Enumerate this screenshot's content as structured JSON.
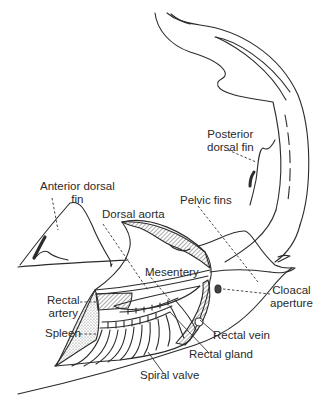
{
  "diagram": {
    "stroke_color": "#2b2b2b",
    "hatch_color": "#555555",
    "background": "#ffffff",
    "labels": {
      "posterior_dorsal_fin": {
        "line1": "Posterior",
        "line2": "dorsal fin"
      },
      "anterior_dorsal_fin": {
        "line1": "Anterior dorsal",
        "line2": "fin"
      },
      "pelvic_fins": "Pelvic fins",
      "dorsal_aorta": "Dorsal aorta",
      "mesentery": "Mesentery",
      "cloacal_aperture": {
        "line1": "Cloacal",
        "line2": "aperture"
      },
      "rectal_artery": {
        "line1": "Rectal",
        "line2": "artery"
      },
      "spleen": "Spleen",
      "rectal_vein": "Rectal vein",
      "rectal_gland": "Rectal gland",
      "spiral_valve": "Spiral valve"
    }
  }
}
